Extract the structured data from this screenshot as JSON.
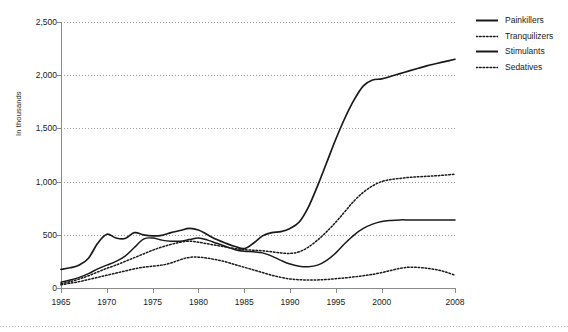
{
  "chart_data": {
    "type": "line",
    "title": "",
    "xlabel": "",
    "ylabel": "In thousands",
    "xlim": [
      1965,
      2008
    ],
    "ylim": [
      0,
      2500
    ],
    "grid": true,
    "grid_axis": "y",
    "legend_position": "right",
    "y_ticks": [
      0,
      500,
      1000,
      1500,
      2000,
      2500
    ],
    "y_tick_labels": [
      "0",
      "500",
      "1,000",
      "1,500",
      "2,000",
      "2,500"
    ],
    "x_ticks": [
      1965,
      1970,
      1975,
      1980,
      1985,
      1990,
      1995,
      2000,
      2008
    ],
    "x_tick_labels": [
      "1965",
      "1970",
      "1975",
      "1980",
      "1985",
      "1990",
      "1995",
      "2000",
      "2008"
    ],
    "x": [
      1965,
      1966,
      1967,
      1968,
      1969,
      1970,
      1971,
      1972,
      1973,
      1974,
      1975,
      1976,
      1977,
      1978,
      1979,
      1980,
      1981,
      1982,
      1983,
      1984,
      1985,
      1986,
      1987,
      1988,
      1989,
      1990,
      1991,
      1992,
      1993,
      1994,
      1995,
      1996,
      1997,
      1998,
      1999,
      2000,
      2001,
      2002,
      2003,
      2004,
      2005,
      2006,
      2007,
      2008
    ],
    "series": [
      {
        "name": "Painkillers",
        "style": "solid",
        "color": "#1a1a1a",
        "values": [
          175,
          190,
          215,
          280,
          420,
          505,
          470,
          465,
          520,
          500,
          490,
          495,
          520,
          540,
          560,
          545,
          500,
          455,
          420,
          390,
          370,
          420,
          490,
          520,
          530,
          560,
          620,
          760,
          960,
          1180,
          1400,
          1600,
          1770,
          1900,
          1955,
          1965,
          1990,
          2015,
          2040,
          2065,
          2090,
          2110,
          2130,
          2150
        ]
      },
      {
        "name": "Tranquilizers",
        "style": "dotted",
        "color": "#1a1a1a",
        "values": [
          40,
          60,
          85,
          115,
          150,
          185,
          215,
          250,
          285,
          320,
          355,
          385,
          410,
          430,
          440,
          430,
          415,
          400,
          385,
          370,
          360,
          355,
          350,
          340,
          330,
          325,
          340,
          385,
          450,
          530,
          620,
          720,
          820,
          900,
          960,
          1000,
          1020,
          1030,
          1040,
          1045,
          1050,
          1055,
          1062,
          1070
        ]
      },
      {
        "name": "Stimulants",
        "style": "solid",
        "color": "#1a1a1a",
        "values": [
          55,
          75,
          100,
          135,
          180,
          215,
          250,
          300,
          380,
          460,
          470,
          450,
          440,
          440,
          455,
          470,
          450,
          420,
          390,
          360,
          345,
          340,
          330,
          300,
          260,
          225,
          205,
          200,
          215,
          260,
          330,
          420,
          500,
          560,
          600,
          625,
          635,
          640,
          640,
          640,
          640,
          640,
          640,
          640
        ]
      },
      {
        "name": "Sedatives",
        "style": "dotted",
        "color": "#1a1a1a",
        "values": [
          30,
          45,
          60,
          80,
          100,
          120,
          140,
          160,
          180,
          195,
          205,
          215,
          235,
          265,
          288,
          290,
          280,
          265,
          245,
          220,
          195,
          170,
          145,
          120,
          100,
          85,
          78,
          75,
          76,
          80,
          88,
          95,
          105,
          115,
          128,
          145,
          165,
          185,
          195,
          193,
          185,
          172,
          150,
          120
        ]
      }
    ]
  }
}
